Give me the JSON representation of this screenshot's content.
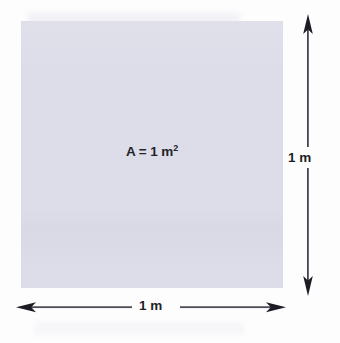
{
  "figure": {
    "background_color": "#fdfdfe"
  },
  "square": {
    "name": "unit-square",
    "fill_color": "#dddde9",
    "area_label": "A = 1 m",
    "area_exponent": "2",
    "area_label_full": "A = 1 m²"
  },
  "dimensions": {
    "vertical": {
      "label": "1 m",
      "orientation": "vertical",
      "arrow_style": "double-headed",
      "color": "#2b2b33"
    },
    "horizontal": {
      "label": "1 m",
      "orientation": "horizontal",
      "arrow_style": "double-headed",
      "color": "#2b2b33"
    }
  }
}
